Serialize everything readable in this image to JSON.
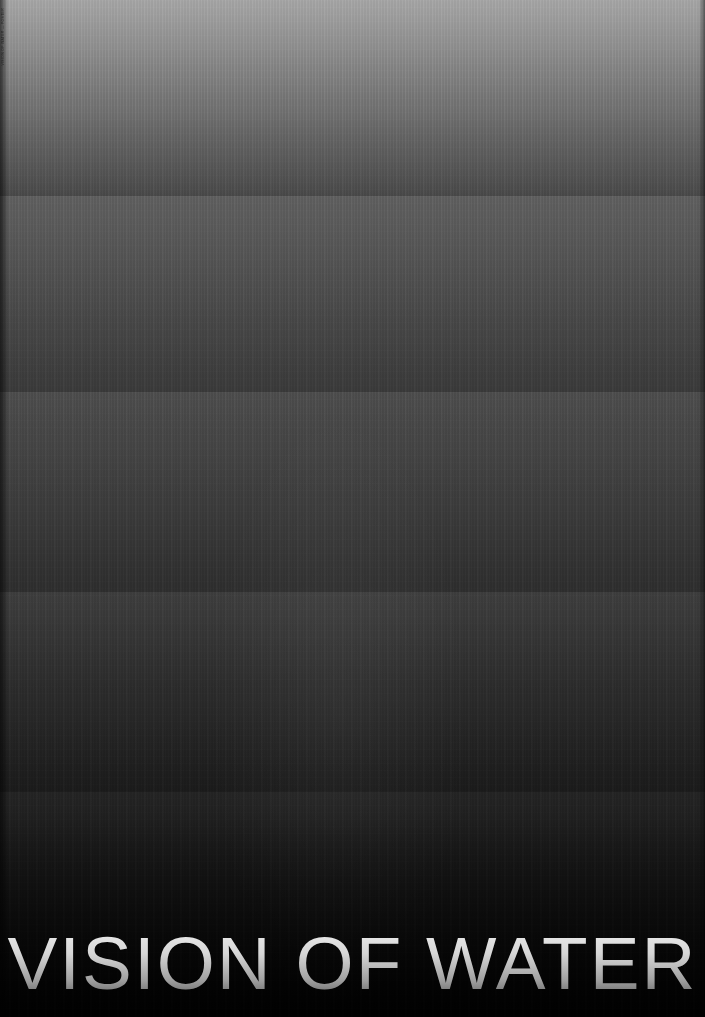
{
  "poster": {
    "title": "VISION OF WATER",
    "credit_text": "VISION OF WATER — POSTER",
    "width": 705,
    "height": 1017,
    "background_color": "#050505",
    "title_gradient": {
      "top_color": "#f2f2f2",
      "mid_color": "#c9c9c9",
      "bottom_color": "#5a5a5a"
    },
    "bands": [
      {
        "name": "band-1",
        "top": 0,
        "height": 196,
        "top_color": "#a6a6a6",
        "bottom_color": "#4a4a4a"
      },
      {
        "name": "band-2",
        "top": 196,
        "height": 196,
        "top_color": "#616161",
        "bottom_color": "#3a3a3a"
      },
      {
        "name": "band-3",
        "top": 392,
        "height": 200,
        "top_color": "#4e4e4e",
        "bottom_color": "#2e2e2e"
      },
      {
        "name": "band-4",
        "top": 592,
        "height": 200,
        "top_color": "#3e3e3e",
        "bottom_color": "#202020"
      },
      {
        "name": "band-5",
        "top": 792,
        "height": 225,
        "top_color": "#2b2b2b",
        "bottom_color": "#040404"
      }
    ]
  }
}
